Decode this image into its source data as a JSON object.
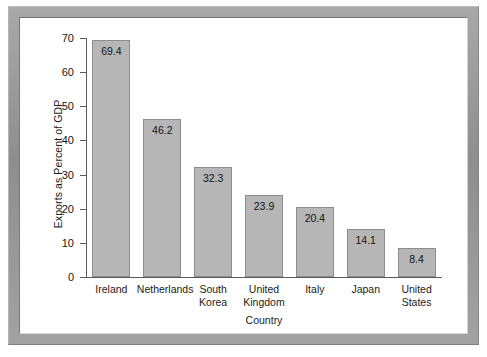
{
  "chart_data": {
    "type": "bar",
    "title": "",
    "xlabel": "Country",
    "ylabel": "Exports as Percent of GDP",
    "categories": [
      "Ireland",
      "Netherlands",
      "South Korea",
      "United Kingdom",
      "Italy",
      "Japan",
      "United States"
    ],
    "category_lines": [
      [
        "Ireland"
      ],
      [
        "Netherlands"
      ],
      [
        "South",
        "Korea"
      ],
      [
        "United",
        "Kingdom"
      ],
      [
        "Italy"
      ],
      [
        "Japan"
      ],
      [
        "United",
        "States"
      ]
    ],
    "values": [
      69.4,
      46.2,
      32.3,
      23.9,
      20.4,
      14.1,
      8.4
    ],
    "value_labels": [
      "69.4",
      "46.2",
      "32.3",
      "23.9",
      "20.4",
      "14.1",
      "8.4"
    ],
    "ylim": [
      0,
      70
    ],
    "yticks": [
      0,
      10,
      20,
      30,
      40,
      50,
      60,
      70
    ],
    "ytick_labels": [
      "0",
      "10",
      "20",
      "30",
      "40",
      "50",
      "60",
      "70"
    ],
    "grid": false,
    "legend": false,
    "bar_color": "#b6b6b6",
    "bar_border_color": "#8d8d8d",
    "axis_color": "#5a5a5a",
    "text_color": "#1b1b1b",
    "background_color": "#ffffff",
    "frame_color": "#9a9a9a"
  }
}
